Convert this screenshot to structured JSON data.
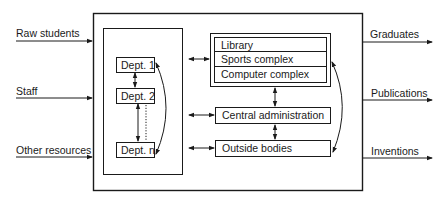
{
  "diagram": {
    "inputs": [
      {
        "label": "Raw students"
      },
      {
        "label": "Staff"
      },
      {
        "label": "Other resources"
      }
    ],
    "outputs": [
      {
        "label": "Graduates"
      },
      {
        "label": "Publications"
      },
      {
        "label": "Inventions"
      }
    ],
    "departments": [
      {
        "label": "Dept. 1"
      },
      {
        "label": "Dept. 2"
      },
      {
        "label": "Dept. n"
      }
    ],
    "shared_facilities": [
      {
        "label": "Library"
      },
      {
        "label": "Sports complex"
      },
      {
        "label": "Computer complex"
      }
    ],
    "central_administration": {
      "label": "Central administration"
    },
    "outside_bodies": {
      "label": "Outside bodies"
    },
    "colors": {
      "line": "#1a1a1a",
      "background": "#ffffff"
    }
  }
}
